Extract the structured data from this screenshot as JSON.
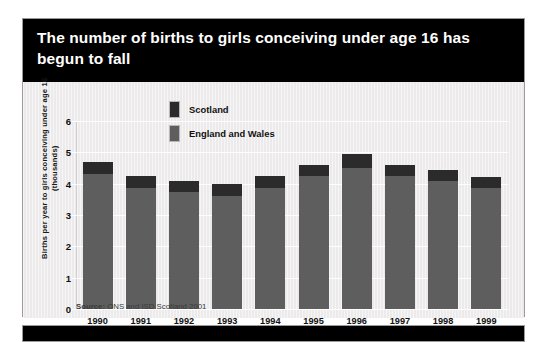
{
  "figure": {
    "title": "The number of births to girls conceiving under age 16 has begun to fall",
    "source": "Source: ONS and ISD Scotland 2001",
    "source_prefix": "Source:",
    "background_color": "#eceaea",
    "title_band_color": "#000000",
    "title_text_color": "#ffffff"
  },
  "legend": {
    "position": "inside-top-center",
    "items": [
      {
        "label": "Scotland",
        "color": "#2b2b2b",
        "icon": "legend-swatch"
      },
      {
        "label": "England and Wales",
        "color": "#5e5e5e",
        "icon": "legend-swatch"
      }
    ]
  },
  "chart_data": {
    "type": "bar",
    "stacked": true,
    "title": "The number of births to girls conceiving under age 16 has begun to fall",
    "subtitle": "",
    "xlabel": "",
    "ylabel": "Births per year to girls conceiving under age 16 (thousands)",
    "categories": [
      "1990",
      "1991",
      "1992",
      "1993",
      "1994",
      "1995",
      "1996",
      "1997",
      "1998",
      "1999"
    ],
    "yticks": [
      0,
      1,
      2,
      3,
      4,
      5,
      6
    ],
    "ytick_labels": [
      "0",
      "1",
      "2",
      "3",
      "4",
      "5",
      "6"
    ],
    "ylim": [
      0,
      6
    ],
    "grid": true,
    "grid_color": "#ffffff",
    "legend_position": "inside-top-center",
    "series": [
      {
        "name": "England and Wales",
        "color": "#5e5e5e",
        "values": [
          4.3,
          3.85,
          3.75,
          3.6,
          3.85,
          4.25,
          4.5,
          4.25,
          4.1,
          3.85
        ]
      },
      {
        "name": "Scotland",
        "color": "#2b2b2b",
        "values": [
          0.4,
          0.4,
          0.35,
          0.4,
          0.4,
          0.35,
          0.45,
          0.35,
          0.35,
          0.35
        ]
      }
    ],
    "totals": [
      4.7,
      4.25,
      4.1,
      4.0,
      4.25,
      4.6,
      4.95,
      4.6,
      4.45,
      4.2
    ]
  }
}
